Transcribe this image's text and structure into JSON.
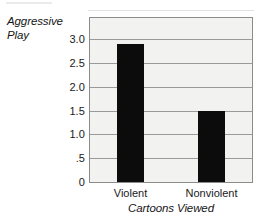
{
  "chart_data": {
    "type": "bar",
    "title": "",
    "subtitle": "",
    "xlabel": "Cartoons Viewed",
    "ylabel": "Aggressive Play",
    "ylabel_lines": [
      "Aggressive",
      "Play"
    ],
    "categories": [
      "Violent",
      "Nonviolent"
    ],
    "values": [
      2.9,
      1.5
    ],
    "series": [
      {
        "name": "Aggressive Play",
        "values": [
          2.9,
          1.5
        ]
      }
    ],
    "ylim": [
      0,
      3.45
    ],
    "yticks": [
      0,
      0.5,
      1.0,
      1.5,
      2.0,
      2.5,
      3.0
    ],
    "ytick_labels": [
      "0",
      ".5",
      "1.0",
      "1.5",
      "2.0",
      "2.5",
      "3.0"
    ],
    "grid": true,
    "grid_axis": "y",
    "legend": false,
    "legend_position": "none",
    "bar_color": "#0c0c0c",
    "plot_background": "#f2f2f1",
    "gridline_color": "#9a9a9a",
    "frame_color": "#8c8c8c",
    "text_color": "#1a1a1a",
    "annotations": []
  }
}
